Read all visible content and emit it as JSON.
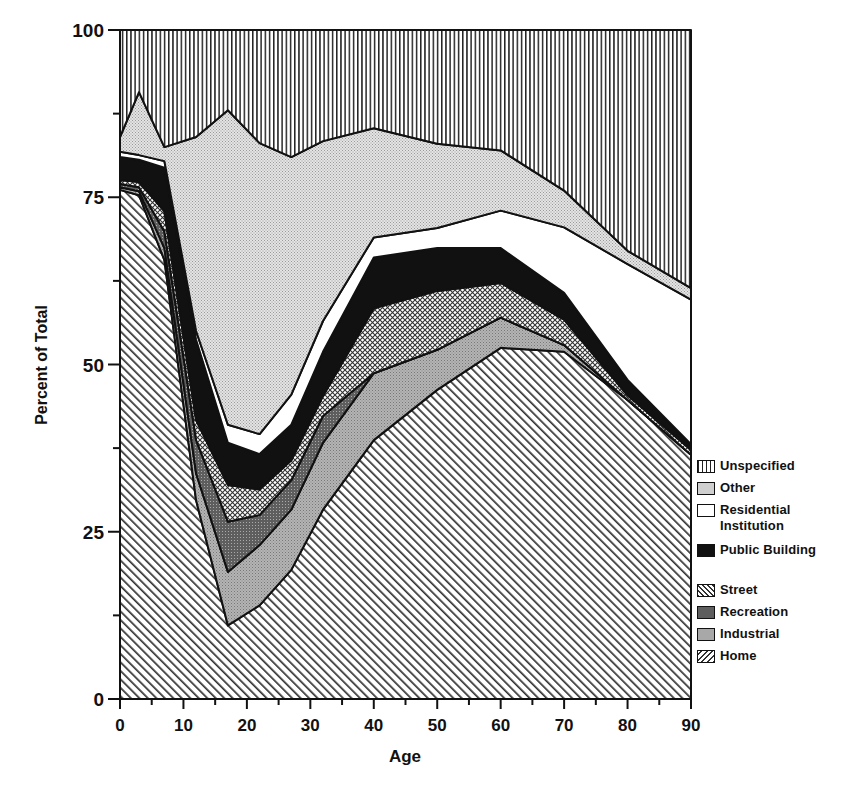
{
  "chart_data": {
    "type": "area",
    "stacked": true,
    "title": "",
    "xlabel": "Age",
    "ylabel": "Percent of Total",
    "xlim": [
      0,
      90
    ],
    "ylim": [
      0,
      100
    ],
    "x_ticks": [
      0,
      10,
      20,
      30,
      40,
      50,
      60,
      70,
      80,
      90
    ],
    "y_ticks": [
      0,
      25,
      50,
      75,
      100
    ],
    "grid": false,
    "legend_position": "right-bottom",
    "x": [
      0,
      3,
      7,
      12,
      17,
      22,
      27,
      32,
      40,
      50,
      60,
      70,
      80,
      90
    ],
    "series": [
      {
        "name": "Home",
        "values": [
          76.1,
          75.3,
          65.6,
          29.7,
          11.0,
          14.0,
          19.3,
          28.3,
          38.7,
          46.2,
          52.5,
          51.9,
          44.7,
          36.5
        ]
      },
      {
        "name": "Industrial",
        "values": [
          0.4,
          0.6,
          1.8,
          4.0,
          8.0,
          9.0,
          9.0,
          10.0,
          10.0,
          6.0,
          4.5,
          1.0,
          0.0,
          0.0
        ]
      },
      {
        "name": "Recreation",
        "values": [
          0.5,
          0.6,
          2.5,
          5.0,
          7.5,
          4.5,
          4.4,
          4.0,
          0.0,
          0.0,
          0.0,
          0.0,
          0.0,
          0.0
        ]
      },
      {
        "name": "Street",
        "values": [
          0.6,
          0.8,
          3.0,
          3.0,
          5.5,
          3.8,
          3.0,
          3.0,
          9.7,
          8.8,
          5.2,
          3.8,
          0.7,
          0.7
        ]
      },
      {
        "name": "Public Building",
        "values": [
          3.4,
          3.3,
          6.5,
          12.0,
          6.3,
          5.3,
          5.3,
          6.6,
          7.6,
          6.4,
          5.2,
          4.0,
          2.3,
          0.9
        ]
      },
      {
        "name": "Residential Institution",
        "values": [
          0.8,
          0.7,
          1.0,
          1.3,
          2.7,
          3.0,
          4.5,
          4.6,
          3.0,
          3.0,
          5.6,
          9.8,
          17.3,
          21.6
        ]
      },
      {
        "name": "Other",
        "values": [
          2.2,
          9.4,
          2.1,
          29.0,
          47.0,
          43.5,
          35.5,
          26.9,
          16.3,
          12.6,
          9.0,
          5.5,
          2.0,
          1.7
        ]
      },
      {
        "name": "Unspecified",
        "values": [
          16.0,
          9.3,
          17.5,
          16.0,
          12.0,
          14.0,
          16.0,
          16.5,
          14.7,
          17.0,
          18.0,
          24.0,
          33.0,
          38.0
        ]
      }
    ],
    "cumulative_tops": {
      "Home": [
        76.1,
        75.3,
        65.6,
        29.7,
        11.0,
        14.0,
        19.3,
        28.3,
        38.7,
        46.2,
        52.5,
        51.9,
        44.7,
        36.5
      ],
      "Industrial": [
        76.5,
        75.9,
        67.4,
        33.7,
        19.0,
        23.0,
        28.3,
        38.3,
        48.7,
        52.2,
        57.0,
        52.9,
        44.7,
        36.5
      ],
      "Recreation": [
        77.0,
        76.5,
        69.9,
        38.7,
        26.5,
        27.5,
        32.7,
        42.3,
        48.7,
        52.2,
        57.0,
        52.9,
        44.7,
        36.5
      ],
      "Street": [
        77.6,
        77.3,
        72.9,
        41.7,
        32.0,
        31.3,
        35.7,
        45.3,
        58.4,
        61.0,
        62.2,
        56.7,
        45.4,
        37.2
      ],
      "Public Building": [
        81.0,
        80.6,
        79.4,
        53.7,
        38.3,
        36.6,
        41.0,
        51.9,
        66.0,
        67.4,
        67.4,
        60.7,
        47.7,
        38.1
      ],
      "Residential Institution": [
        81.8,
        81.3,
        80.4,
        55.0,
        41.0,
        39.6,
        45.5,
        56.5,
        69.0,
        70.4,
        73.0,
        70.5,
        65.0,
        59.7
      ],
      "Other": [
        84.0,
        90.7,
        82.5,
        84.0,
        88.0,
        83.1,
        81.0,
        83.4,
        85.3,
        83.0,
        82.0,
        76.0,
        67.0,
        61.4
      ],
      "Unspecified": [
        100,
        100,
        100,
        100,
        100,
        100,
        100,
        100,
        100,
        100,
        100,
        100,
        100,
        100
      ]
    }
  },
  "axes": {
    "x_label": "Age",
    "y_label": "Percent of Total",
    "x_tick_labels": [
      "0",
      "10",
      "20",
      "30",
      "40",
      "50",
      "60",
      "70",
      "80",
      "90"
    ],
    "y_tick_labels": [
      "0",
      "25",
      "50",
      "75",
      "100"
    ]
  },
  "legend": {
    "items": [
      {
        "label": "Unspecified",
        "pattern": "vlines",
        "two_line": false
      },
      {
        "label": "Other",
        "pattern": "fine-dots",
        "two_line": false
      },
      {
        "label": "Residential Institution",
        "pattern": "white",
        "two_line": true
      },
      {
        "label": "Public Building",
        "pattern": "black",
        "two_line": true
      },
      {
        "label": "Street",
        "pattern": "crosshatch",
        "two_line": false
      },
      {
        "label": "Recreation",
        "pattern": "dark-dots",
        "two_line": false
      },
      {
        "label": "Industrial",
        "pattern": "medium-dots",
        "two_line": false
      },
      {
        "label": "Home",
        "pattern": "diagonal",
        "two_line": false
      }
    ]
  },
  "colors": {
    "ink": "#111111",
    "paper": "#ffffff",
    "other_fill": "#d6d6d6",
    "industrial_fill": "#a8a8a8",
    "recreation_fill": "#707070"
  }
}
